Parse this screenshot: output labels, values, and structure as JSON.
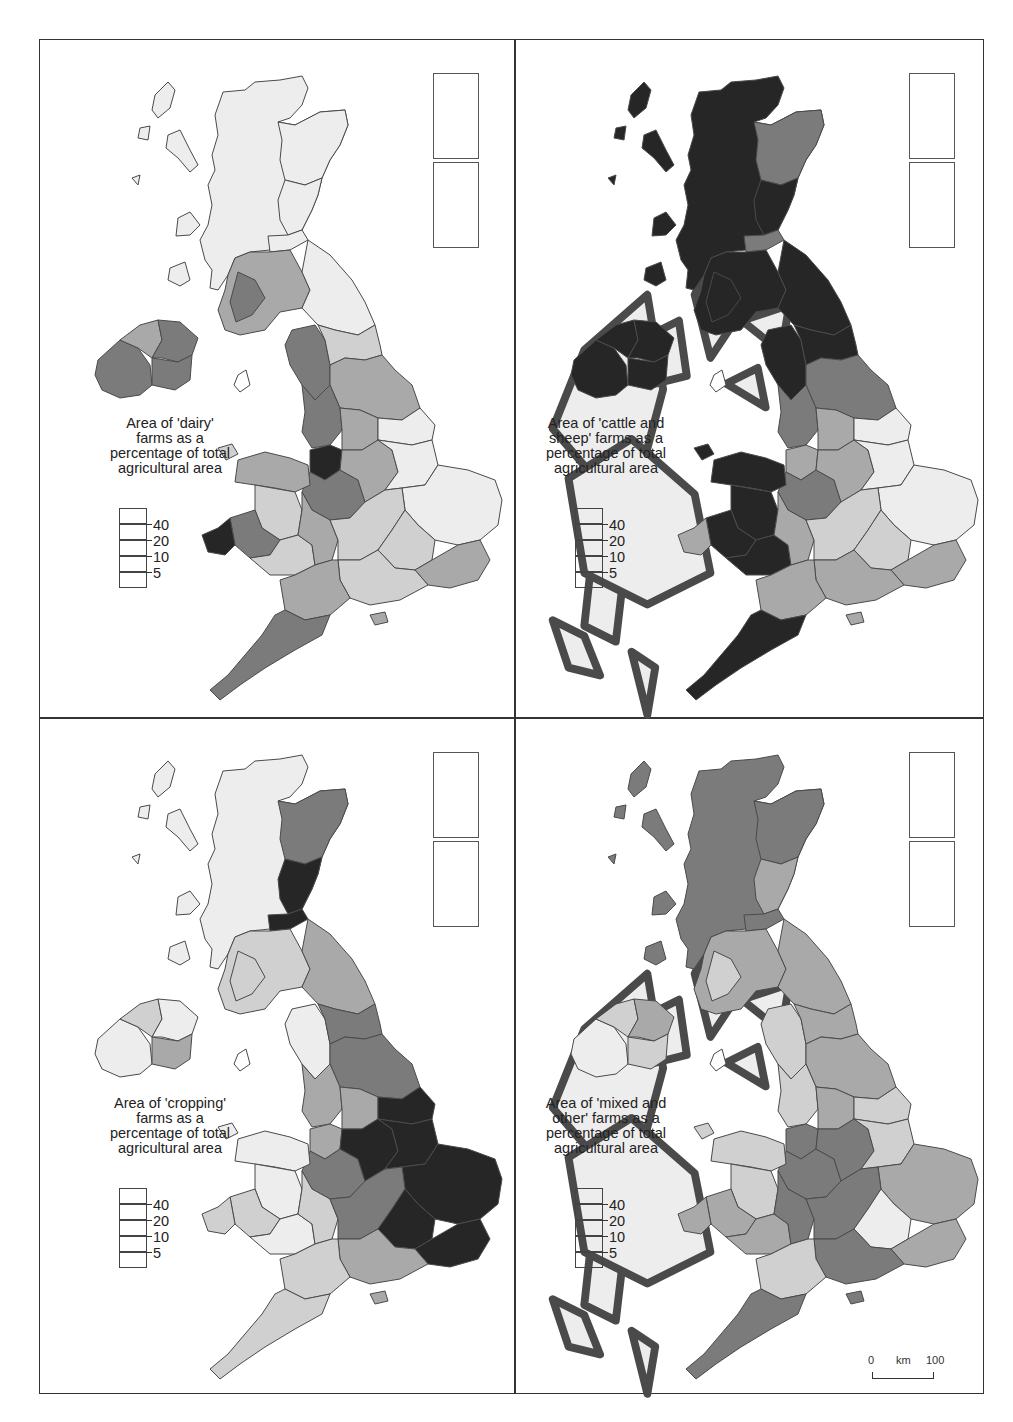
{
  "figure": {
    "layout": "2x2 grid of choropleth maps of the United Kingdom",
    "legend_classes": [
      {
        "label": "40",
        "meaning": ">40",
        "color": "#262626"
      },
      {
        "label": "20",
        "meaning": "20-40",
        "color": "#7b7b7b"
      },
      {
        "label": "10",
        "meaning": "10-20",
        "color": "#a9a9a9"
      },
      {
        "label": "5",
        "meaning": "5-10",
        "color": "#d0d0d0"
      },
      {
        "label": "",
        "meaning": "<5",
        "color": "#ededed"
      }
    ],
    "legend_ticks": [
      "40",
      "20",
      "10",
      "5"
    ],
    "scale_bar": {
      "start": "0",
      "unit": "km",
      "end": "100"
    }
  },
  "maps": [
    {
      "id": "dairy",
      "caption": "Area of 'dairy' farms as a percentage of total agricultural area",
      "caption_lines": [
        "Area of 'dairy'",
        "farms as a",
        "percentage of total",
        "agricultural area"
      ],
      "regions": {
        "highlands": 1,
        "islands_west": 1,
        "grampian": 1,
        "tayside_fife": 1,
        "lothian": 1,
        "strathclyde_s": 3,
        "dumfries": 4,
        "borders": 1,
        "ni_west": 4,
        "ni_north": 3,
        "ni_east": 4,
        "ni_south": 4,
        "cumbria": 4,
        "northumberland": 2,
        "yorks_n": 3,
        "lancs": 4,
        "yorks_w": 3,
        "humber": 1,
        "cheshire": 5,
        "midlands_w": 4,
        "midlands_e": 3,
        "lincs": 1,
        "east_anglia": 1,
        "wales_n": 3,
        "wales_mid": 2,
        "dyfed": 4,
        "pembroke": 5,
        "wales_s": 2,
        "glos": 3,
        "oxon": 2,
        "home_counties": 2,
        "kent": 3,
        "southwest": 4,
        "wessex": 3,
        "hants": 2,
        "shetland": 1,
        "orkney": 1,
        "isle_of_man": 0,
        "iow": 3,
        "anglesey": 2
      }
    },
    {
      "id": "cattle_sheep",
      "caption": "Area of 'cattle and sheep' farms as a percentage of total agricultural area",
      "caption_lines": [
        "Area of 'cattle and",
        "sheep' farms as a",
        "percentage of total",
        "agricultural area"
      ],
      "regions": {
        "highlands": 5,
        "islands_west": 5,
        "grampian": 4,
        "tayside_fife": 5,
        "lothian": 4,
        "strathclyde_s": 5,
        "dumfries": 5,
        "borders": 5,
        "ni_west": 5,
        "ni_north": 5,
        "ni_east": 5,
        "ni_south": 5,
        "cumbria": 5,
        "northumberland": 5,
        "yorks_n": 4,
        "lancs": 4,
        "yorks_w": 3,
        "humber": 1,
        "cheshire": 3,
        "midlands_w": 4,
        "midlands_e": 3,
        "lincs": 1,
        "east_anglia": 1,
        "wales_n": 5,
        "wales_mid": 5,
        "dyfed": 5,
        "pembroke": 3,
        "wales_s": 5,
        "glos": 3,
        "oxon": 2,
        "home_counties": 2,
        "kent": 3,
        "southwest": 5,
        "wessex": 3,
        "hants": 3,
        "shetland": 5,
        "orkney": 5,
        "isle_of_man": 0,
        "iow": 3,
        "anglesey": 5
      }
    },
    {
      "id": "cropping",
      "caption": "Area of 'cropping' farms as a percentage of total agricultural area",
      "caption_lines": [
        "Area of 'cropping'",
        "farms as a",
        "percentage of total",
        "agricultural area"
      ],
      "regions": {
        "highlands": 1,
        "islands_west": 1,
        "grampian": 4,
        "tayside_fife": 5,
        "lothian": 5,
        "strathclyde_s": 2,
        "dumfries": 2,
        "borders": 3,
        "ni_west": 1,
        "ni_north": 2,
        "ni_east": 1,
        "ni_south": 3,
        "cumbria": 1,
        "northumberland": 4,
        "yorks_n": 4,
        "lancs": 3,
        "yorks_w": 3,
        "humber": 5,
        "cheshire": 3,
        "midlands_w": 4,
        "midlands_e": 5,
        "lincs": 5,
        "east_anglia": 5,
        "wales_n": 1,
        "wales_mid": 1,
        "dyfed": 2,
        "pembroke": 2,
        "wales_s": 1,
        "glos": 2,
        "oxon": 4,
        "home_counties": 5,
        "kent": 5,
        "southwest": 2,
        "wessex": 2,
        "hants": 3,
        "shetland": 1,
        "orkney": 1,
        "isle_of_man": 0,
        "iow": 3,
        "anglesey": 1
      }
    },
    {
      "id": "mixed_other",
      "caption": "Area of 'mixed and other' farms as a percentage of total agricultural area",
      "caption_lines": [
        "Area of 'mixed and",
        "other' farms as a",
        "percentage of total",
        "agricultural area"
      ],
      "regions": {
        "highlands": 4,
        "islands_west": 4,
        "grampian": 4,
        "tayside_fife": 3,
        "lothian": 4,
        "strathclyde_s": 3,
        "dumfries": 2,
        "borders": 3,
        "ni_west": 1,
        "ni_north": 2,
        "ni_east": 3,
        "ni_south": 2,
        "cumbria": 2,
        "northumberland": 3,
        "yorks_n": 3,
        "lancs": 2,
        "yorks_w": 3,
        "humber": 2,
        "cheshire": 4,
        "midlands_w": 4,
        "midlands_e": 4,
        "lincs": 2,
        "east_anglia": 3,
        "wales_n": 2,
        "wales_mid": 2,
        "dyfed": 3,
        "pembroke": 3,
        "wales_s": 3,
        "glos": 4,
        "oxon": 4,
        "home_counties": 1,
        "kent": 3,
        "southwest": 4,
        "wessex": 2,
        "hants": 4,
        "shetland": 3,
        "orkney": 3,
        "isle_of_man": 0,
        "iow": 4,
        "anglesey": 2
      }
    }
  ]
}
